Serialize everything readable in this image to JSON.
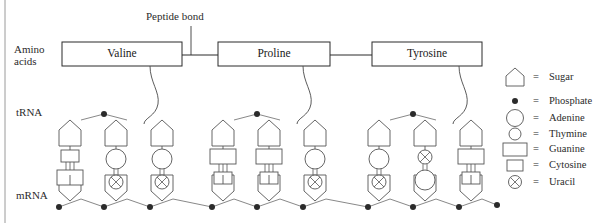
{
  "diagram": {
    "border_color": "#9a9a9a",
    "line_color": "#3a3a3a",
    "background": "#ffffff"
  },
  "callout": {
    "peptide_bond_label": "Peptide bond"
  },
  "row_labels": {
    "amino_acids_line1": "Amino",
    "amino_acids_line2": "acids",
    "trna": "tRNA",
    "mrna": "mRNA"
  },
  "amino_acids": [
    {
      "name": "Valine",
      "x": 62,
      "width": 120
    },
    {
      "name": "Proline",
      "x": 218,
      "width": 112
    },
    {
      "name": "Tyrosine",
      "x": 372,
      "width": 110
    }
  ],
  "legend": {
    "items": [
      {
        "icon": "sugar-pentagon-icon",
        "equals": "=",
        "label": "Sugar"
      },
      {
        "icon": "phosphate-dot-icon",
        "equals": "=",
        "label": "Phosphate"
      },
      {
        "icon": "adenine-large-circle-icon",
        "equals": "=",
        "label": "Adenine"
      },
      {
        "icon": "thymine-small-circle-icon",
        "equals": "=",
        "label": "Thymine"
      },
      {
        "icon": "guanine-large-rect-icon",
        "equals": "=",
        "label": "Guanine"
      },
      {
        "icon": "cytosine-small-square-icon",
        "equals": "=",
        "label": "Cytosine"
      },
      {
        "icon": "uracil-crossed-circle-icon",
        "equals": "=",
        "label": "Uracil"
      }
    ]
  },
  "codons": [
    {
      "amino_acid": "Valine",
      "trna_anticodon": [
        "Cytosine",
        "Adenine",
        "Adenine"
      ],
      "mrna_codon": [
        "Guanine",
        "Uracil",
        "Uracil"
      ]
    },
    {
      "amino_acid": "Proline",
      "trna_anticodon": [
        "Guanine",
        "Guanine",
        "Adenine"
      ],
      "mrna_codon": [
        "Cytosine",
        "Cytosine",
        "Uracil"
      ]
    },
    {
      "amino_acid": "Tyrosine",
      "trna_anticodon": [
        "Adenine",
        "Uracil",
        "Guanine"
      ],
      "mrna_codon": [
        "Uracil",
        "Adenine",
        "Cytosine"
      ]
    }
  ]
}
